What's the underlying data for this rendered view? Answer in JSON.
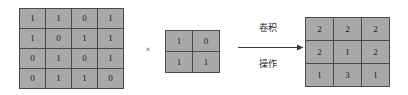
{
  "diagram": {
    "type": "convolution-operation",
    "input_matrix": {
      "name": "input-feature-map",
      "rows": 4,
      "cols": 4,
      "values": [
        [
          "1",
          "1",
          "0",
          "1"
        ],
        [
          "1",
          "0",
          "1",
          "1"
        ],
        [
          "0",
          "1",
          "0",
          "1"
        ],
        [
          "0",
          "1",
          "1",
          "0"
        ]
      ]
    },
    "operator_symbol": "×",
    "kernel_matrix": {
      "name": "convolution-kernel",
      "rows": 2,
      "cols": 2,
      "values": [
        [
          "1",
          "0"
        ],
        [
          "1",
          "1"
        ]
      ]
    },
    "arrow": {
      "label_top": "卷积",
      "label_bottom": "操作",
      "direction": "right"
    },
    "output_matrix": {
      "name": "output-feature-map",
      "rows": 3,
      "cols": 3,
      "values": [
        [
          "2",
          "2",
          "2"
        ],
        [
          "2",
          "1",
          "2"
        ],
        [
          "1",
          "3",
          "1"
        ]
      ]
    },
    "colors": {
      "cell_fill": "#a9a9a9",
      "cell_border": "#4a4a4a",
      "text": "#1a1a1a",
      "background": "#ffffff",
      "arrow": "#3a3a3a"
    }
  }
}
